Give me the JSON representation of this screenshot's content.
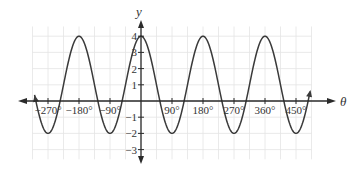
{
  "chart_data": {
    "type": "line",
    "title": "",
    "xlabel": "θ",
    "ylabel": "y",
    "equation_shape": "y = 1 + 3cos(2θ)",
    "x_ticks": [
      "−270°",
      "−180°",
      "−90°",
      "90°",
      "180°",
      "270°",
      "360°",
      "450°"
    ],
    "x_tick_values": [
      -270,
      -180,
      -90,
      90,
      180,
      270,
      360,
      450
    ],
    "y_ticks": [
      "4",
      "3",
      "2",
      "1",
      "−1",
      "−2",
      "−3"
    ],
    "y_tick_values": [
      4,
      3,
      2,
      1,
      -1,
      -2,
      -3
    ],
    "xlim": [
      -315,
      495
    ],
    "ylim": [
      -3.5,
      4.6
    ],
    "grid": true,
    "series": [
      {
        "name": "curve",
        "x": [
          -315,
          -270,
          -225,
          -180,
          -135,
          -90,
          -45,
          0,
          45,
          90,
          135,
          180,
          225,
          270,
          315,
          360,
          405,
          450,
          495
        ],
        "values": [
          1,
          -2,
          1,
          4,
          1,
          -2,
          1,
          4,
          1,
          -2,
          1,
          4,
          1,
          -2,
          1,
          4,
          1,
          -2,
          1
        ]
      }
    ],
    "maxima": [
      {
        "x": -180,
        "y": 4
      },
      {
        "x": 0,
        "y": 4
      },
      {
        "x": 180,
        "y": 4
      },
      {
        "x": 360,
        "y": 4
      }
    ],
    "minima": [
      {
        "x": -270,
        "y": -2
      },
      {
        "x": -90,
        "y": -2
      },
      {
        "x": 90,
        "y": -2
      },
      {
        "x": 270,
        "y": -2
      },
      {
        "x": 450,
        "y": -2
      }
    ]
  },
  "labels": {
    "x_axis": "θ",
    "y_axis": "y"
  }
}
